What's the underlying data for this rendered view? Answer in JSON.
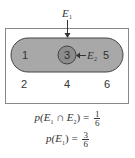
{
  "diagram": {
    "sample_space_outcomes": [
      "1",
      "3",
      "5",
      "2",
      "4",
      "6"
    ],
    "event_labels": {
      "E1": {
        "base": "E",
        "sub": "1"
      },
      "E2": {
        "base": "E",
        "sub": "2"
      }
    },
    "colors": {
      "capsule_fill": "#a8a8a8",
      "circle_fill": "#8c8c8c",
      "outline": "#444444",
      "box_border": "#888888"
    }
  },
  "formulas": [
    {
      "lhs": "p(E",
      "sub1": "1",
      "mid": " ∩ E",
      "sub2": "2",
      "close": ") = ",
      "num": "1",
      "den": "6"
    },
    {
      "lhs": "p(E",
      "sub1": "1",
      "close": ") = ",
      "num": "3",
      "den": "6"
    }
  ]
}
